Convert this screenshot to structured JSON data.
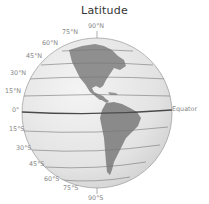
{
  "title": "Latitude",
  "labels": {
    "n90": "90°N",
    "n75": "75°N",
    "n60": "60°N",
    "n45": "45°N",
    "n30": "30°N",
    "n15": "15°N",
    "eq": "0°",
    "s15": "15°S",
    "s30": "30°S",
    "s45": "45°S",
    "s60": "60°S",
    "s75": "75°S",
    "s90": "90°S",
    "equator": "Equator"
  },
  "colors": {
    "globe": "#e6e6e6",
    "land": "#8f8f8f",
    "lines": "#6e6e6e",
    "equator": "#4a4a4a",
    "label": "#8a8a8a"
  }
}
